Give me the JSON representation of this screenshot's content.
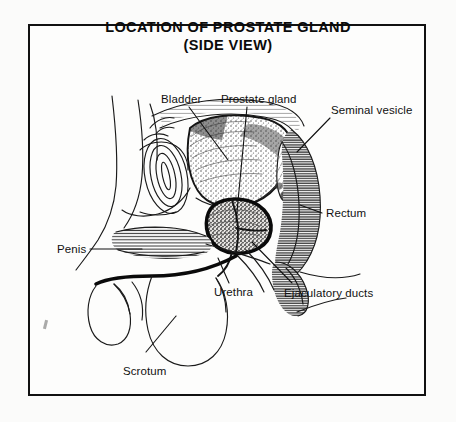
{
  "document": {
    "type": "anatomical-illustration",
    "title_lines": [
      "LOCATION OF PROSTATE GLAND",
      "(SIDE VIEW)"
    ],
    "view": "side view (sagittal section)",
    "background_color": "#fbfbfa",
    "ink_color": "#111111",
    "border_color": "#111111"
  },
  "labels": {
    "bladder": "Bladder",
    "prostate_gland": "Prostate gland",
    "seminal_vesicle": "Seminal vesicle",
    "rectum": "Rectum",
    "ejaculatory_ducts": "Ejaculatory ducts",
    "urethra": "Urethra",
    "scrotum": "Scrotum",
    "penis": "Penis"
  },
  "structures": [
    {
      "name": "bladder",
      "label": "Bladder",
      "texture": "stipple",
      "position": "upper-center"
    },
    {
      "name": "prostate-gland",
      "label": "Prostate gland",
      "texture": "dark-stipple",
      "position": "center"
    },
    {
      "name": "seminal-vesicle",
      "label": "Seminal vesicle",
      "texture": "hatch",
      "position": "center-right"
    },
    {
      "name": "rectum",
      "label": "Rectum",
      "texture": "dense-hatch",
      "position": "right"
    },
    {
      "name": "ejaculatory-ducts",
      "label": "Ejaculatory ducts",
      "texture": "line",
      "position": "lower-center"
    },
    {
      "name": "urethra",
      "label": "Urethra",
      "texture": "line",
      "position": "lower-center"
    },
    {
      "name": "scrotum",
      "label": "Scrotum",
      "texture": "outline",
      "position": "lower-left"
    },
    {
      "name": "penis",
      "label": "Penis",
      "texture": "outline",
      "position": "left"
    },
    {
      "name": "pubic-bone",
      "label": "",
      "texture": "concentric-oval",
      "position": "center-left"
    }
  ]
}
